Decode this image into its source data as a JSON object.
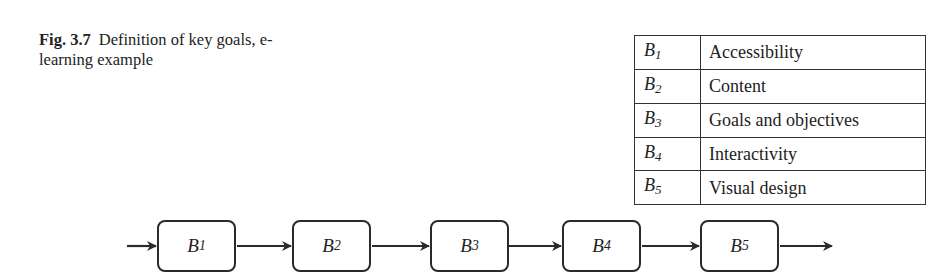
{
  "caption": {
    "label": "Fig. 3.7",
    "text": "Definition of key goals, e-learning example"
  },
  "legend": {
    "rows": [
      {
        "symbol": "B",
        "index": "1",
        "description": "Accessibility"
      },
      {
        "symbol": "B",
        "index": "2",
        "description": "Content"
      },
      {
        "symbol": "B",
        "index": "3",
        "description": "Goals and objectives"
      },
      {
        "symbol": "B",
        "index": "4",
        "description": "Interactivity"
      },
      {
        "symbol": "B",
        "index": "5",
        "description": "Visual design"
      }
    ]
  },
  "flow": {
    "nodes": [
      {
        "symbol": "B",
        "index": "1"
      },
      {
        "symbol": "B",
        "index": "2"
      },
      {
        "symbol": "B",
        "index": "3"
      },
      {
        "symbol": "B",
        "index": "4"
      },
      {
        "symbol": "B",
        "index": "5"
      }
    ],
    "colors": {
      "stroke": "#2a2a2a"
    }
  }
}
